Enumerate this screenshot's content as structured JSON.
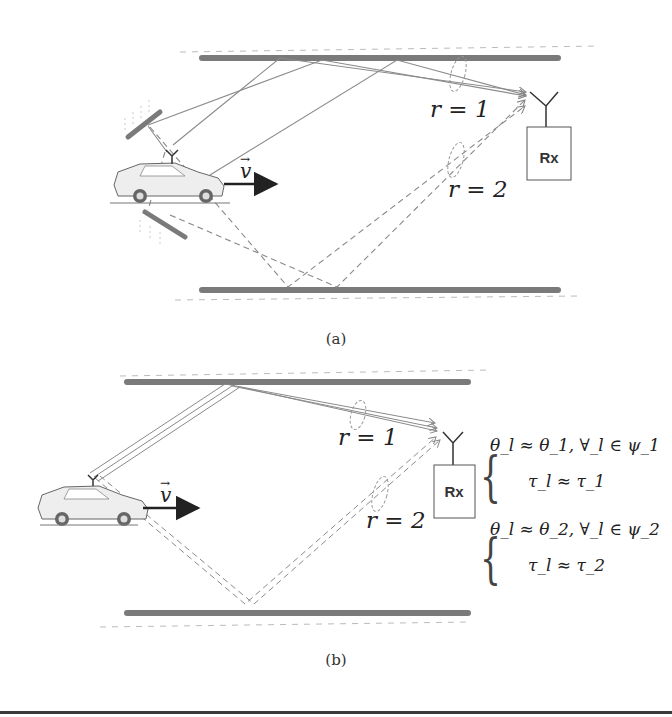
{
  "panel_a": {
    "caption": "(a)",
    "rx_label": "Rx",
    "velocity_label": "v",
    "cluster_labels": [
      "r = 1",
      "r = 2"
    ]
  },
  "panel_b": {
    "caption": "(b)",
    "rx_label": "Rx",
    "velocity_label": "v",
    "cluster_labels": [
      "r = 1",
      "r = 2"
    ],
    "equations": {
      "group1": {
        "line1": "θ_l ≈ θ_1, ∀_l ∈ ψ_1",
        "line2": "τ_l ≈ τ_1"
      },
      "group2": {
        "line1": "θ_l ≈ θ_2, ∀_l ∈ ψ_2",
        "line2": "τ_l ≈ τ_2"
      }
    }
  },
  "colors": {
    "wall": "#7a7a7a",
    "ray": "#8a8a8a",
    "arrow": "#222222"
  }
}
